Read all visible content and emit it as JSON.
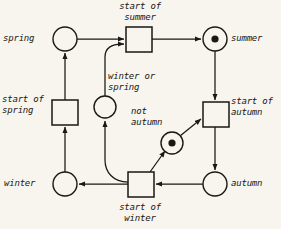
{
  "diagram": {
    "type": "petri-net",
    "canvas": {
      "width": 281,
      "height": 229
    },
    "colors": {
      "background": "#f7f5ee",
      "stroke": "#1a1714",
      "token": "#1a1714",
      "node_fill": "#f7f5ee"
    },
    "places": [
      {
        "id": "spring",
        "label": "spring",
        "tokens": 0,
        "cx": 65,
        "cy": 39,
        "r": 12,
        "label_x": 3,
        "label_y": 33,
        "label_align": "left"
      },
      {
        "id": "summer",
        "label": "summer",
        "tokens": 1,
        "cx": 215,
        "cy": 39,
        "r": 12,
        "label_x": 231,
        "label_y": 33,
        "label_align": "left"
      },
      {
        "id": "autumn",
        "label": "autumn",
        "tokens": 0,
        "cx": 215,
        "cy": 184,
        "r": 12,
        "label_x": 231,
        "label_y": 178,
        "label_align": "left"
      },
      {
        "id": "winter",
        "label": "winter",
        "tokens": 0,
        "cx": 65,
        "cy": 184,
        "r": 12,
        "label_x": 4,
        "label_y": 178,
        "label_align": "left"
      },
      {
        "id": "winter-or-spring",
        "label": "winter or\nspring",
        "tokens": 0,
        "cx": 105,
        "cy": 107,
        "r": 11,
        "label_x": 108,
        "label_y": 71,
        "label_align": "left"
      },
      {
        "id": "not-autumn",
        "label": "not\nautumn",
        "tokens": 1,
        "cx": 172,
        "cy": 143,
        "r": 11,
        "label_x": 131,
        "label_y": 106,
        "label_align": "left"
      }
    ],
    "transitions": [
      {
        "id": "start-of-summer",
        "label": "start of\nsummer",
        "x": 126,
        "y": 27,
        "w": 26,
        "h": 25,
        "label_x": 104,
        "label_y": 1,
        "label_align": "center",
        "label_w": 72
      },
      {
        "id": "start-of-autumn",
        "label": "start of\nautumn",
        "x": 203,
        "y": 102,
        "w": 26,
        "h": 25,
        "label_x": 231,
        "label_y": 96,
        "label_align": "left"
      },
      {
        "id": "start-of-winter",
        "label": "start of\nwinter",
        "x": 128,
        "y": 172,
        "w": 26,
        "h": 25,
        "label_x": 104,
        "label_y": 202,
        "label_align": "center",
        "label_w": 72
      },
      {
        "id": "start-of-spring",
        "label": "start of\nspring",
        "x": 52,
        "y": 100,
        "w": 26,
        "h": 25,
        "label_x": 2,
        "label_y": 94,
        "label_align": "left"
      }
    ],
    "arcs": [
      {
        "id": "arc-spring-to-start-of-summer",
        "from": "spring",
        "to": "start-of-summer"
      },
      {
        "id": "arc-start-of-summer-to-summer",
        "from": "start-of-summer",
        "to": "summer"
      },
      {
        "id": "arc-summer-to-start-of-autumn",
        "from": "summer",
        "to": "start-of-autumn"
      },
      {
        "id": "arc-start-of-autumn-to-autumn",
        "from": "start-of-autumn",
        "to": "autumn"
      },
      {
        "id": "arc-autumn-to-start-of-winter",
        "from": "autumn",
        "to": "start-of-winter"
      },
      {
        "id": "arc-start-of-winter-to-winter",
        "from": "start-of-winter",
        "to": "winter"
      },
      {
        "id": "arc-winter-to-start-of-spring",
        "from": "winter",
        "to": "start-of-spring"
      },
      {
        "id": "arc-start-of-spring-to-spring",
        "from": "start-of-spring",
        "to": "spring"
      },
      {
        "id": "arc-start-of-winter-to-winter-or-spring",
        "from": "start-of-winter",
        "to": "winter-or-spring"
      },
      {
        "id": "arc-winter-or-spring-to-start-of-summer",
        "from": "winter-or-spring",
        "to": "start-of-summer"
      },
      {
        "id": "arc-start-of-winter-to-not-autumn",
        "from": "start-of-winter",
        "to": "not-autumn"
      },
      {
        "id": "arc-not-autumn-to-start-of-autumn",
        "from": "not-autumn",
        "to": "start-of-autumn"
      }
    ]
  }
}
